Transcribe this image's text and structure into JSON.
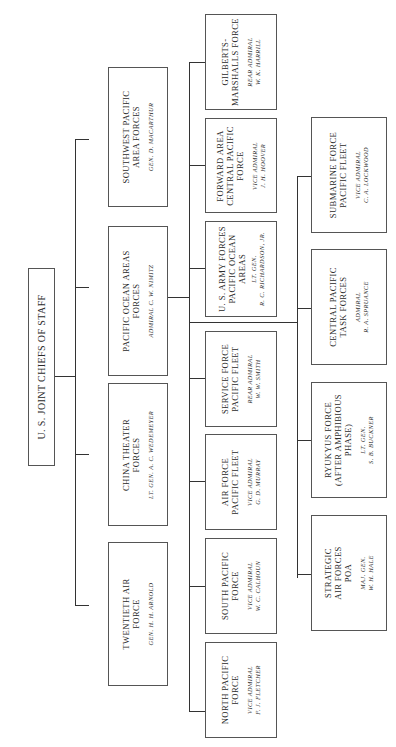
{
  "chart": {
    "date_label": "January 1945",
    "root": {
      "title": "U. S. JOINT CHIEFS OF STAFF"
    },
    "tier1": [
      {
        "title_lines": [
          "SOUTHWEST PACIFIC",
          "AREA FORCES"
        ],
        "commander": [
          "GEN. D. MACARTHUR"
        ]
      },
      {
        "title_lines": [
          "PACIFIC OCEAN AREAS",
          "FORCES"
        ],
        "commander": [
          "ADMIRAL C. W. NIMITZ"
        ]
      },
      {
        "title_lines": [
          "CHINA THEATER",
          "FORCES"
        ],
        "commander": [
          "LT. GEN. A. C. WEDEMEYER"
        ]
      },
      {
        "title_lines": [
          "TWENTIETH AIR",
          "FORCE"
        ],
        "commander": [
          "GEN. H. H. ARNOLD"
        ]
      }
    ],
    "tier2": [
      {
        "title_lines": [
          "GILBERTS-",
          "MARSHALLS FORCE"
        ],
        "commander": [
          "REAR ADMIRAL",
          "W. K. HARRILL"
        ]
      },
      {
        "title_lines": [
          "FORWARD AREA",
          "CENTRAL PACIFIC",
          "FORCE"
        ],
        "commander": [
          "VICE ADMIRAL",
          "J. H. HOOVER"
        ]
      },
      {
        "title_lines": [
          "U. S. ARMY FORCES",
          "PACIFIC OCEAN",
          "AREAS"
        ],
        "commander": [
          "LT. GEN.",
          "R. C. RICHARDSON, JR."
        ]
      },
      {
        "title_lines": [
          "SERVICE FORCE",
          "PACIFIC FLEET"
        ],
        "commander": [
          "REAR ADMIRAL",
          "W. W. SMITH"
        ]
      },
      {
        "title_lines": [
          "AIR FORCE",
          "PACIFIC FLEET"
        ],
        "commander": [
          "VICE ADMIRAL",
          "G. D. MURRAY"
        ]
      },
      {
        "title_lines": [
          "SOUTH PACIFIC",
          "FORCE"
        ],
        "commander": [
          "VICE ADMIRAL",
          "W. C. CALHOUN"
        ]
      },
      {
        "title_lines": [
          "NORTH PACIFIC",
          "FORCE"
        ],
        "commander": [
          "VICE ADMIRAL",
          "F. J. FLETCHER"
        ]
      }
    ],
    "tier3": [
      {
        "title_lines": [
          "SUBMARINE FORCE",
          "PACIFIC FLEET"
        ],
        "commander": [
          "VICE ADMIRAL",
          "C. A. LOCKWOOD"
        ]
      },
      {
        "title_lines": [
          "CENTRAL PACIFIC",
          "TASK FORCES"
        ],
        "commander": [
          "ADMIRAL",
          "R. A. SPRUANCE"
        ]
      },
      {
        "title_lines": [
          "RYUKYUS FORCE",
          "(AFTER AMPHIBIOUS",
          "PHASE)"
        ],
        "commander": [
          "LT. GEN.",
          "S. B. BUCKNER"
        ]
      },
      {
        "title_lines": [
          "STRATEGIC",
          "AIR FORCES",
          "POA"
        ],
        "commander": [
          "MAJ. GEN.",
          "W. H. HALE"
        ]
      }
    ]
  }
}
